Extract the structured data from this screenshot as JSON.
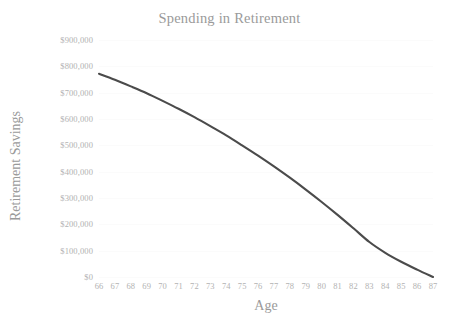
{
  "chart_data": {
    "type": "line",
    "title": "Spending in Retirement",
    "xlabel": "Age",
    "ylabel": "Retirement Savings",
    "x": [
      66,
      67,
      68,
      69,
      70,
      71,
      72,
      73,
      74,
      75,
      76,
      77,
      78,
      79,
      80,
      81,
      82,
      83,
      84,
      85,
      86,
      87
    ],
    "values": [
      772000,
      749000,
      724000,
      698000,
      669000,
      639000,
      607000,
      573000,
      538000,
      500000,
      461000,
      420000,
      377000,
      332000,
      285000,
      236000,
      185000,
      133000,
      92000,
      58000,
      28000,
      0
    ],
    "series": [
      {
        "name": "Retirement Savings",
        "color": "#4b4b4b",
        "values": [
          772000,
          749000,
          724000,
          698000,
          669000,
          639000,
          607000,
          573000,
          538000,
          500000,
          461000,
          420000,
          377000,
          332000,
          285000,
          236000,
          185000,
          133000,
          92000,
          58000,
          28000,
          0
        ]
      }
    ],
    "xlim": [
      66,
      87
    ],
    "ylim": [
      0,
      900000
    ],
    "y_ticks": [
      0,
      100000,
      200000,
      300000,
      400000,
      500000,
      600000,
      700000,
      800000,
      900000
    ],
    "y_tick_labels": [
      "$0",
      "$100,000",
      "$200,000",
      "$300,000",
      "$400,000",
      "$500,000",
      "$600,000",
      "$700,000",
      "$800,000",
      "$900,000"
    ],
    "x_tick_labels": [
      "66",
      "67",
      "68",
      "69",
      "70",
      "71",
      "72",
      "73",
      "74",
      "75",
      "76",
      "77",
      "78",
      "79",
      "80",
      "81",
      "82",
      "83",
      "84",
      "85",
      "86",
      "87"
    ],
    "grid": true,
    "grid_color": "#fbfbfb",
    "legend": null,
    "legend_position": "none",
    "text_color": "#b2b2b2",
    "title_color": "#9a9a9a",
    "background": "#ffffff"
  }
}
